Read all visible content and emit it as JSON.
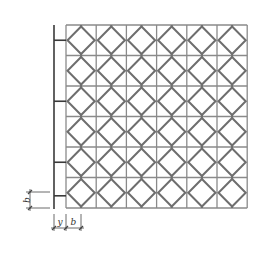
{
  "diagram": {
    "type": "tile-pattern-layout",
    "grid": {
      "columns": 6,
      "rows": 6,
      "left": 66,
      "top": 25,
      "cell_width": 30.2,
      "cell_height": 30.5,
      "cell_motif": "diamond-inscribed-square"
    },
    "colors": {
      "grid_line": "#8a8a8a",
      "diamond_line": "#6e6e6e",
      "support_bar": "#3a3a3a",
      "dimension_line": "#444444",
      "background": "#ffffff"
    },
    "support_bar": {
      "x": 54,
      "top": 25,
      "bottom": 209,
      "connector_rows": [
        0,
        2,
        4,
        6
      ]
    },
    "dimensions": {
      "vertical_b": {
        "label": "b",
        "x": 30,
        "y_top": 192,
        "y_bottom": 208
      },
      "horizontal_y": {
        "label": "y",
        "x_left": 54,
        "x_right": 66,
        "y": 228
      },
      "horizontal_b": {
        "label": "b",
        "x_left": 66,
        "x_right": 81,
        "y": 228
      }
    }
  }
}
